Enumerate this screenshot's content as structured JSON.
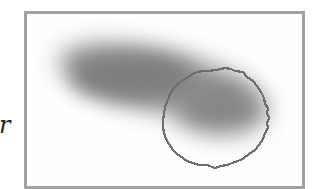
{
  "figure": {
    "side_text": "r",
    "frame": {
      "border_color": "#a2a2a2",
      "background": "#fefefe"
    },
    "blob": {
      "shape": "blurred elongated gray region",
      "color": "#808080"
    },
    "circle": {
      "shape": "jagged pixelated circle outline",
      "color": "#707070",
      "center_x": 202,
      "center_y": 107,
      "radius": 50
    }
  }
}
